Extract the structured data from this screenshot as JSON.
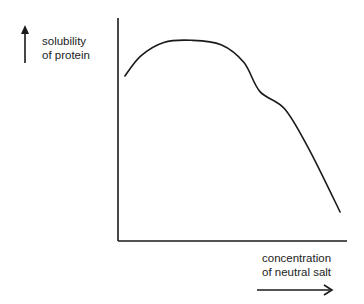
{
  "chart_data": {
    "type": "line",
    "title": "",
    "ylabel": [
      "solubility",
      "of protein"
    ],
    "xlabel": [
      "concentration",
      "of neutral salt"
    ],
    "x_ticks": [],
    "y_ticks": [],
    "grid": false,
    "legend": null,
    "axis_ranges": {
      "x": [
        0,
        1
      ],
      "y": [
        0,
        1
      ]
    },
    "series": [
      {
        "name": "protein solubility",
        "x": [
          0.03,
          0.1,
          0.2,
          0.32,
          0.45,
          0.55,
          0.62,
          0.73,
          0.84,
          0.97
        ],
        "y": [
          0.74,
          0.83,
          0.89,
          0.9,
          0.88,
          0.8,
          0.67,
          0.59,
          0.4,
          0.13
        ]
      }
    ],
    "annotations": [
      {
        "type": "arrow",
        "direction": "up",
        "meaning": "increasing solubility"
      },
      {
        "type": "arrow",
        "direction": "right",
        "meaning": "increasing salt concentration"
      }
    ]
  },
  "labels": {
    "y_line1": "solubility",
    "y_line2": "of protein",
    "x_line1": "concentration",
    "x_line2": "of neutral salt"
  },
  "colors": {
    "ink": "#1a1a1a",
    "background": "#ffffff"
  },
  "plot_px": {
    "x0": 118,
    "x1": 347,
    "y0": 241,
    "y1": 18
  }
}
